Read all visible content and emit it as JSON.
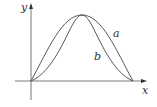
{
  "diagram": {
    "axes": {
      "x_label": "x",
      "y_label": "y"
    },
    "curves": [
      {
        "name": "a",
        "label": "a",
        "description": "sine-like arch from origin to x-intercept"
      },
      {
        "name": "b",
        "label": "b",
        "description": "sine-squared-like arch, flatter near ends, steeper near peak"
      }
    ],
    "colors": {
      "stroke": "#444444",
      "background": "#ffffff"
    }
  }
}
